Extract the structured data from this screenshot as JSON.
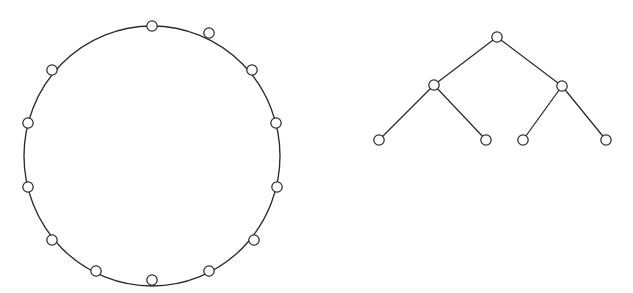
{
  "figure": {
    "background_color": "#ffffff",
    "stroke_color": "#2b2b2b",
    "node_fill_color": "#ffffff",
    "canvas": {
      "width": 633,
      "height": 293
    },
    "panels": [
      {
        "id": "cycle-graph",
        "name": "cycle-graph",
        "type": "cycle",
        "node_count": 13,
        "edge_count": 13,
        "center": {
          "x": 152,
          "y": 156
        },
        "radius_x": 128,
        "radius_y": 130,
        "node_radius": 5.2,
        "start_angle_deg": -90,
        "nodes": [
          {
            "id": "c0",
            "x": 152,
            "y": 26,
            "label": ""
          },
          {
            "id": "c1",
            "x": 209,
            "y": 33,
            "label": ""
          },
          {
            "id": "c2",
            "x": 252,
            "y": 70,
            "label": ""
          },
          {
            "id": "c3",
            "x": 276,
            "y": 123,
            "label": ""
          },
          {
            "id": "c4",
            "x": 277,
            "y": 187,
            "label": ""
          },
          {
            "id": "c5",
            "x": 254,
            "y": 240,
            "label": ""
          },
          {
            "id": "c6",
            "x": 209,
            "y": 271,
            "label": ""
          },
          {
            "id": "c7",
            "x": 152,
            "y": 280,
            "label": ""
          },
          {
            "id": "c8",
            "x": 96,
            "y": 271,
            "label": ""
          },
          {
            "id": "c9",
            "x": 52,
            "y": 240,
            "label": ""
          },
          {
            "id": "c10",
            "x": 28,
            "y": 187,
            "label": ""
          },
          {
            "id": "c11",
            "x": 28,
            "y": 123,
            "label": ""
          },
          {
            "id": "c12",
            "x": 52,
            "y": 70,
            "label": ""
          }
        ],
        "edges": [
          [
            "c0",
            "c1"
          ],
          [
            "c1",
            "c2"
          ],
          [
            "c2",
            "c3"
          ],
          [
            "c3",
            "c4"
          ],
          [
            "c4",
            "c5"
          ],
          [
            "c5",
            "c6"
          ],
          [
            "c6",
            "c7"
          ],
          [
            "c7",
            "c8"
          ],
          [
            "c8",
            "c9"
          ],
          [
            "c9",
            "c10"
          ],
          [
            "c10",
            "c11"
          ],
          [
            "c11",
            "c12"
          ],
          [
            "c12",
            "c0"
          ]
        ]
      },
      {
        "id": "binary-tree-graph",
        "name": "binary-tree-graph",
        "type": "tree",
        "node_count": 7,
        "edge_count": 6,
        "depth": 2,
        "node_radius": 5.2,
        "nodes": [
          {
            "id": "t-root",
            "x": 497,
            "y": 37,
            "level": 0,
            "label": ""
          },
          {
            "id": "t-left",
            "x": 434,
            "y": 85,
            "level": 1,
            "label": ""
          },
          {
            "id": "t-right",
            "x": 562,
            "y": 86,
            "level": 1,
            "label": ""
          },
          {
            "id": "t-leaf-1",
            "x": 379,
            "y": 140,
            "level": 2,
            "label": ""
          },
          {
            "id": "t-leaf-2",
            "x": 486,
            "y": 140,
            "level": 2,
            "label": ""
          },
          {
            "id": "t-leaf-3",
            "x": 523,
            "y": 140,
            "level": 2,
            "label": ""
          },
          {
            "id": "t-leaf-4",
            "x": 606,
            "y": 140,
            "level": 2,
            "label": ""
          }
        ],
        "edges": [
          [
            "t-root",
            "t-left"
          ],
          [
            "t-root",
            "t-right"
          ],
          [
            "t-left",
            "t-leaf-1"
          ],
          [
            "t-left",
            "t-leaf-2"
          ],
          [
            "t-right",
            "t-leaf-3"
          ],
          [
            "t-right",
            "t-leaf-4"
          ]
        ]
      }
    ]
  }
}
